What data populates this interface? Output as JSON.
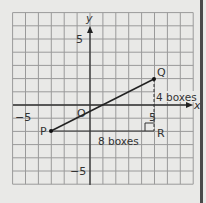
{
  "diagram": {
    "type": "coordinate-grid",
    "axes": {
      "x_label": "x",
      "y_label": "y",
      "origin_label": "O"
    },
    "x_range": [
      -6,
      8
    ],
    "y_range": [
      -6,
      7
    ],
    "ticks": {
      "x_neg": "−5",
      "x_pos": "5",
      "y_pos": "5",
      "y_neg": "−5"
    },
    "points": [
      {
        "name": "P",
        "x": -3,
        "y": -2
      },
      {
        "name": "Q",
        "x": 5,
        "y": 2
      },
      {
        "name": "R",
        "x": 5,
        "y": -2
      }
    ],
    "annotations": {
      "horizontal": "8 boxes",
      "vertical": "4 boxes"
    },
    "colors": {
      "grid": "#8a8a8a",
      "axis": "#333333",
      "line": "#222222",
      "background": "#e9e9e7"
    }
  }
}
